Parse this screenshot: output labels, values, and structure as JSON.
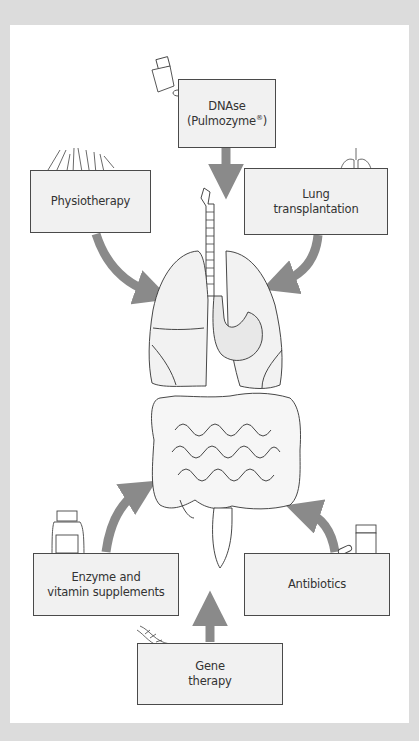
{
  "diagram": {
    "type": "treatment-overview",
    "center": "Organs: trachea, lungs, stomach, liver, intestines",
    "colors": {
      "background_frame": "#dcdcdc",
      "panel": "#ffffff",
      "box_fill": "#f1f1f1",
      "box_border": "#4a4a4a",
      "arrow": "#8a8a8a",
      "text": "#333333"
    },
    "treatments": [
      {
        "id": "dnase",
        "line1": "DNAse",
        "line2": "(Pulmozyme",
        "reg": "®",
        "line2_end": ")",
        "icon": "inhaler-icon",
        "target": "lungs"
      },
      {
        "id": "physio",
        "line1": "Physiotherapy",
        "icon": "hands-icon",
        "target": "lungs"
      },
      {
        "id": "lung-tx",
        "line1": "Lung",
        "line2": "transplantation",
        "icon": "lungs-icon",
        "target": "lungs"
      },
      {
        "id": "enzyme",
        "line1": "Enzyme and",
        "line2": "vitamin supplements",
        "icon": "pill-bottle-icon",
        "target": "intestines"
      },
      {
        "id": "antibiotics",
        "line1": "Antibiotics",
        "icon": "pill-jar-icon",
        "target": "intestines"
      },
      {
        "id": "gene",
        "line1": "Gene",
        "line2": "therapy",
        "icon": "dna-icon",
        "target": "intestines"
      }
    ]
  }
}
